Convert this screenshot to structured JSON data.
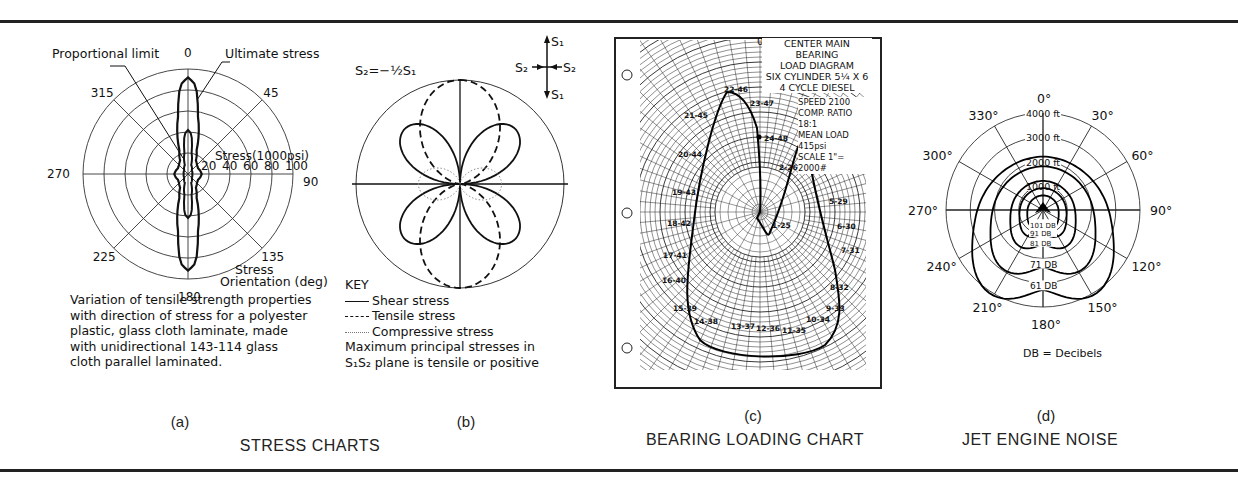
{
  "figure": {
    "section_titles": {
      "stress": "STRESS CHARTS",
      "bearing": "BEARING LOADING CHART",
      "jet": "JET ENGINE NOISE"
    },
    "panel_labels": [
      "(a)",
      "(b)",
      "(c)",
      "(d)"
    ]
  },
  "chart_data": [
    {
      "id": "a",
      "type": "polar",
      "title": "",
      "annotations": {
        "proportional_limit": "Proportional limit",
        "ultimate_stress": "Ultimate stress",
        "radial_axis_title": "Stress(1000psi)",
        "angle_axis_title_1": "Stress",
        "angle_axis_title_2": "Orientation (deg)"
      },
      "radial_ticks": [
        "20",
        "40",
        "60",
        "80",
        "100"
      ],
      "radial_range": [
        0,
        100
      ],
      "angle_ticks": [
        "0",
        "45",
        "90",
        "135",
        "180",
        "225",
        "270",
        "315"
      ],
      "series": [
        {
          "name": "Ultimate stress",
          "angles_deg": [
            0,
            5,
            10,
            20,
            30,
            45,
            60,
            75,
            90,
            105,
            120,
            135,
            150,
            160,
            170,
            175,
            180
          ],
          "values": [
            92,
            85,
            55,
            24,
            15,
            12,
            11,
            12,
            13,
            12,
            11,
            12,
            15,
            24,
            55,
            85,
            92
          ]
        },
        {
          "name": "Proportional limit",
          "angles_deg": [
            0,
            5,
            10,
            20,
            45,
            90,
            135,
            160,
            170,
            175,
            180
          ],
          "values": [
            42,
            38,
            20,
            9,
            5,
            4,
            5,
            9,
            20,
            38,
            42
          ]
        }
      ],
      "caption": [
        "Variation of tensile strength properties",
        "with direction of stress for a polyester",
        "plastic, glass cloth laminate, made",
        "with unidirectional 143-114 glass",
        "cloth parallel laminated."
      ]
    },
    {
      "id": "b",
      "type": "polar",
      "equation": "S₂=−½S₁",
      "stress_element_labels": {
        "s1_top": "S₁",
        "s1_bottom": "S₁",
        "s2_left": "S₂",
        "s2_right": "S₂"
      },
      "series": [
        {
          "name": "Shear stress",
          "style": "solid",
          "description": "four-leaf rose, lobes at 45/135/225/315 deg",
          "relative_max": 0.75
        },
        {
          "name": "Tensile stress",
          "style": "dashed",
          "description": "vertical figure-eight along 0/180 deg",
          "relative_max": 1.0
        },
        {
          "name": "Compressive stress",
          "style": "dotted",
          "description": "horizontal figure-eight along 90/270 deg",
          "relative_max": 0.5
        }
      ],
      "key": {
        "title": "KEY",
        "items": [
          {
            "line": "——",
            "label": "Shear stress"
          },
          {
            "line": "- - -",
            "label": "Tensile stress"
          },
          {
            "line": "······",
            "label": "Compressive stress"
          }
        ],
        "note_1": "Maximum principal stresses in",
        "note_2": "S₁S₂ plane is tensile or positive"
      }
    },
    {
      "id": "c",
      "type": "polar",
      "title_lines": [
        "CENTER MAIN BEARING",
        "LOAD DIAGRAM",
        "SIX CYLINDER 5¼ X 6",
        "4 CYCLE DIESEL"
      ],
      "specs": [
        "SPEED 2100",
        "COMP. RATIO 18:1",
        "MEAN LOAD 415psi",
        "SCALE 1\"= 2000#"
      ],
      "top_angle_label": "0",
      "point_labels": [
        "22-46",
        "21-45",
        "20-44",
        "19-43",
        "18-42",
        "17-41",
        "16-40",
        "15-39",
        "14-38",
        "13-37",
        "12-36",
        "11-35",
        "10-34",
        "9-33",
        "8-32",
        "7-31",
        "6-30",
        "5-29",
        "4-28",
        "3-27",
        "2-26",
        "1-25",
        "24-48",
        "23-47"
      ]
    },
    {
      "id": "d",
      "type": "polar",
      "angle_ticks": [
        "0°",
        "30°",
        "60°",
        "90°",
        "120°",
        "150°",
        "180°",
        "210°",
        "240°",
        "270°",
        "300°",
        "330°"
      ],
      "radial_ticks": [
        "1000 ft",
        "2000 ft",
        "3000 ft",
        "4000 ft"
      ],
      "radial_range": [
        0,
        4000
      ],
      "contours": [
        {
          "label": "61 DB",
          "front_ft": 2200,
          "rear_ft": 3500
        },
        {
          "label": "71 DB",
          "front_ft": 1800,
          "rear_ft": 2500
        },
        {
          "label": "81 DB",
          "front_ft": 1200,
          "rear_ft": 1500
        },
        {
          "label": "91 DB",
          "front_ft": 900,
          "rear_ft": 1050
        },
        {
          "label": "101 DB",
          "front_ft": 600,
          "rear_ft": 700
        }
      ],
      "legend_note": "DB = Decibels"
    }
  ]
}
